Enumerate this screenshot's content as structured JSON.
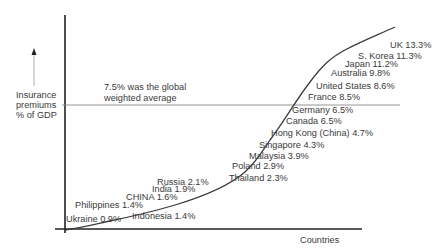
{
  "chart_data": {
    "type": "line",
    "title": "",
    "xlabel": "Countries",
    "ylabel": "Insurance premiums % of GDP",
    "ylabel_lines": [
      "Insurance",
      "premiums",
      "% of GDP"
    ],
    "grid": false,
    "legend": "none",
    "reference_line": {
      "value": 7.5,
      "annotation_lines": [
        "7.5% was the global",
        "weighted average"
      ]
    },
    "points": [
      {
        "country": "Ukraine",
        "value": 0.9,
        "label": "Ukraine 0.9%"
      },
      {
        "country": "Philippines",
        "value": 1.4,
        "label": "Philippines 1.4%"
      },
      {
        "country": "Indonesia",
        "value": 1.4,
        "label": "Indonesia 1.4%"
      },
      {
        "country": "CHINA",
        "value": 1.6,
        "label": "CHINA 1.6%"
      },
      {
        "country": "India",
        "value": 1.9,
        "label": "India 1.9%"
      },
      {
        "country": "Russia",
        "value": 2.1,
        "label": "Russia 2.1%"
      },
      {
        "country": "Thailand",
        "value": 2.3,
        "label": "Thailand 2.3%"
      },
      {
        "country": "Poland",
        "value": 2.9,
        "label": "Poland 2.9%"
      },
      {
        "country": "Malaysia",
        "value": 3.9,
        "label": "Malaysia 3.9%"
      },
      {
        "country": "Singapore",
        "value": 4.3,
        "label": "Singapore 4.3%"
      },
      {
        "country": "Hong Kong (China)",
        "value": 4.7,
        "label": "Hong Kong (China) 4.7%"
      },
      {
        "country": "Canada",
        "value": 6.5,
        "label": "Canada 6.5%"
      },
      {
        "country": "Germany",
        "value": 6.5,
        "label": "Germany 6.5%"
      },
      {
        "country": "France",
        "value": 8.5,
        "label": "France 8.5%"
      },
      {
        "country": "United States",
        "value": 8.6,
        "label": "United States 8.6%"
      },
      {
        "country": "Australia",
        "value": 9.8,
        "label": "Australia 9.8%"
      },
      {
        "country": "Japan",
        "value": 11.2,
        "label": "Japan 11.2%"
      },
      {
        "country": "S. Korea",
        "value": 11.3,
        "label": "S. Korea 11.3%"
      },
      {
        "country": "UK",
        "value": 13.3,
        "label": "UK 13.3%"
      }
    ],
    "colors": {
      "curve": "#3c3c3c",
      "axis": "#222222",
      "reference_line": "#888888",
      "text": "#3a3a3a"
    }
  }
}
